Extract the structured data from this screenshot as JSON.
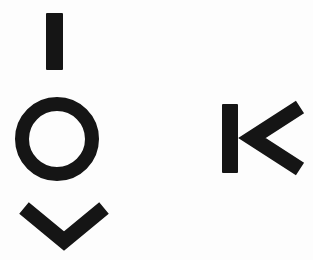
{
  "image": {
    "title": "Hand-drawn symbol glyphs",
    "width": 313,
    "height": 260,
    "background_color": "#fdfdfd",
    "ink_color": "#151515",
    "description": "Four thick black marks on a white background: a vertical bar, a ring, a downward chevron, and a K-like mark made of a bar plus a left-pointing chevron."
  },
  "glyphs": [
    {
      "id": "vertical-bar",
      "name": "vertical-bar-glyph",
      "label": "Vertical bar",
      "shape": "bar",
      "x": 46,
      "y": 13,
      "width": 17,
      "height": 57,
      "stroke_width": 17,
      "color": "#151515"
    },
    {
      "id": "ring",
      "name": "ring-glyph",
      "label": "Ring",
      "shape": "circle-outline",
      "center_x": 57,
      "center_y": 139,
      "radius": 35,
      "stroke_width": 14,
      "color": "#151515"
    },
    {
      "id": "chevron-down",
      "name": "chevron-down-glyph",
      "label": "Downward chevron",
      "shape": "chevron",
      "direction": "down",
      "left_x": 24,
      "left_y": 208,
      "vertex_x": 64,
      "vertex_y": 241,
      "right_x": 104,
      "right_y": 208,
      "stroke_width": 15,
      "color": "#151515"
    },
    {
      "id": "k-mark",
      "name": "k-mark-glyph",
      "label": "K mark",
      "shape": "composite",
      "parts": [
        {
          "id": "k-stem",
          "name": "k-stem-bar",
          "label": "K stem",
          "shape": "bar",
          "x": 222,
          "y": 104,
          "width": 16,
          "height": 69,
          "color": "#151515"
        },
        {
          "id": "k-chevron",
          "name": "chevron-left-glyph",
          "label": "Left-pointing chevron",
          "shape": "chevron",
          "direction": "left",
          "top_x": 300,
          "top_y": 107,
          "vertex_x": 252,
          "vertex_y": 138,
          "bottom_x": 300,
          "bottom_y": 169,
          "stroke_width": 15,
          "color": "#151515"
        }
      ]
    }
  ]
}
